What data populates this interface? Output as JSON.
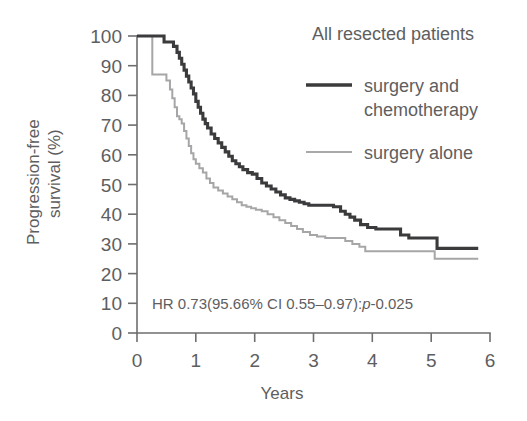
{
  "chart_data": {
    "type": "line",
    "title": "All resected patients",
    "xlabel": "Years",
    "ylabel_line1": "Progression-free",
    "ylabel_line2": "survival (%)",
    "ylabel": "Progression-free survival (%)",
    "xlim": [
      0,
      6
    ],
    "ylim": [
      0,
      100
    ],
    "xticks": [
      0,
      1,
      2,
      3,
      4,
      5,
      6
    ],
    "xtick_labels": [
      "0",
      "1",
      "2",
      "3",
      "4",
      "5",
      "6"
    ],
    "yticks": [
      0,
      10,
      20,
      30,
      40,
      50,
      60,
      70,
      80,
      90,
      100
    ],
    "ytick_labels": [
      "0",
      "10",
      "20",
      "30",
      "40",
      "50",
      "60",
      "70",
      "80",
      "90",
      "100"
    ],
    "grid": false,
    "legend_position": "upper-right",
    "annotation": "HR 0.73(95.66% CI 0.55–0.97):",
    "annotation_italic": "p",
    "annotation_tail": "-0.025",
    "annotation_full": "HR 0.73(95.66% CI 0.55–0.97):p-0.025",
    "hazard_ratio": 0.73,
    "ci_level": "95.66%",
    "ci_low": 0.55,
    "ci_high": 0.97,
    "p_value": 0.025,
    "colors": {
      "treatment": "#3b3b3d",
      "control": "#a6a6a8",
      "axis": "#6e6e70",
      "text": "#5e5e60",
      "background": "#ffffff"
    },
    "series": [
      {
        "name": "surgery and chemotherapy",
        "legend_label_line1": "surgery and",
        "legend_label_line2": "chemotherapy",
        "color": "#3b3b3d",
        "style": "step-post",
        "x": [
          0.0,
          0.38,
          0.46,
          0.56,
          0.62,
          0.68,
          0.72,
          0.76,
          0.8,
          0.84,
          0.88,
          0.92,
          0.96,
          1.0,
          1.04,
          1.08,
          1.12,
          1.16,
          1.2,
          1.26,
          1.32,
          1.38,
          1.44,
          1.5,
          1.56,
          1.62,
          1.68,
          1.74,
          1.8,
          1.88,
          1.96,
          2.04,
          2.12,
          2.2,
          2.28,
          2.36,
          2.44,
          2.52,
          2.6,
          2.68,
          2.76,
          2.84,
          2.92,
          3.05,
          3.2,
          3.34,
          3.46,
          3.54,
          3.62,
          3.7,
          3.8,
          3.92,
          4.06,
          4.24,
          4.48,
          4.62,
          4.98,
          5.1,
          5.8
        ],
        "y": [
          100.0,
          100.0,
          98.0,
          98.0,
          96.5,
          94.5,
          92.5,
          90.5,
          88.5,
          86.5,
          84.5,
          82.5,
          80.5,
          78.0,
          76.0,
          74.0,
          72.0,
          70.5,
          69.0,
          67.0,
          65.5,
          64.0,
          62.5,
          61.0,
          59.5,
          58.0,
          57.0,
          56.0,
          55.0,
          54.0,
          53.5,
          52.0,
          50.5,
          49.5,
          48.5,
          47.5,
          46.5,
          45.5,
          45.0,
          44.5,
          44.0,
          43.5,
          43.0,
          43.0,
          43.0,
          42.5,
          41.0,
          40.0,
          39.0,
          38.0,
          36.5,
          35.5,
          35.0,
          35.0,
          33.0,
          32.0,
          32.0,
          28.5,
          28.5
        ],
        "plateau_value": 28.5
      },
      {
        "name": "surgery alone",
        "legend_label_line1": "surgery alone",
        "legend_label_line2": "",
        "color": "#a6a6a8",
        "style": "step-post",
        "x": [
          0.0,
          0.18,
          0.26,
          0.44,
          0.5,
          0.56,
          0.6,
          0.64,
          0.68,
          0.72,
          0.76,
          0.8,
          0.84,
          0.88,
          0.92,
          0.96,
          1.0,
          1.06,
          1.12,
          1.18,
          1.24,
          1.3,
          1.38,
          1.46,
          1.54,
          1.62,
          1.7,
          1.78,
          1.86,
          1.94,
          2.02,
          2.12,
          2.22,
          2.32,
          2.42,
          2.52,
          2.62,
          2.72,
          2.82,
          2.94,
          3.06,
          3.2,
          3.4,
          3.54,
          3.66,
          3.78,
          3.88,
          4.0,
          4.4,
          4.96,
          5.06,
          5.8
        ],
        "y": [
          100.0,
          100.0,
          87.0,
          87.0,
          85.0,
          82.0,
          79.0,
          76.0,
          73.0,
          72.0,
          70.5,
          68.0,
          65.5,
          63.0,
          60.5,
          58.5,
          57.0,
          55.5,
          54.0,
          52.0,
          50.5,
          49.0,
          48.0,
          47.0,
          46.0,
          45.0,
          44.0,
          43.0,
          42.5,
          42.0,
          41.5,
          41.0,
          40.0,
          39.0,
          38.0,
          37.0,
          36.0,
          35.0,
          34.0,
          33.0,
          32.5,
          32.0,
          32.0,
          31.0,
          30.0,
          29.0,
          27.5,
          27.5,
          27.5,
          27.5,
          25.0,
          25.0
        ],
        "plateau_value": 25.0
      }
    ]
  }
}
